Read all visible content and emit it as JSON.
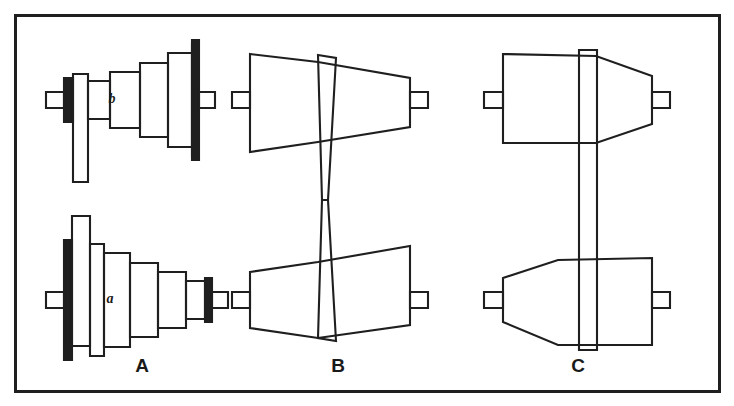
{
  "figure": {
    "background_color": "#ffffff",
    "ink_color": "#1f1f1f",
    "border": {
      "name": "figure-frame",
      "x": 14,
      "y": 14,
      "width": 706,
      "height": 378,
      "stroke_width": 3
    },
    "panels": [
      {
        "id": "A",
        "label": "A",
        "label_x": 142,
        "label_y": 372,
        "type": "stepped-cone-pulleys",
        "description": "Pair of stepped cone pulleys with flat belt on matching steps",
        "upper": {
          "part_label": "b",
          "part_label_x": 112,
          "part_label_y": 103,
          "steps": 5,
          "belt_step": 1,
          "orientation": "small-to-large-left-to-right"
        },
        "lower": {
          "part_label": "a",
          "part_label_x": 110,
          "part_label_y": 303,
          "steps": 5,
          "belt_step": 5,
          "orientation": "large-to-small-left-to-right"
        }
      },
      {
        "id": "B",
        "label": "B",
        "label_x": 338,
        "label_y": 372,
        "type": "tapered-cone-pulleys-crossed-belt",
        "description": "Pair of opposed tapered cones with belt crossing at the centre",
        "upper": {
          "taper": "large-left-small-right"
        },
        "lower": {
          "taper": "small-left-large-right"
        },
        "belt": "crossed"
      },
      {
        "id": "C",
        "label": "C",
        "label_x": 578,
        "label_y": 372,
        "type": "tapered-cone-pulleys-straight-belt",
        "description": "Pair of tapered cones with straight parallel belt",
        "upper": {
          "taper": "straight-then-tapered-right"
        },
        "lower": {
          "taper": "tapered-left-straight-right"
        },
        "belt": "straight"
      }
    ]
  }
}
